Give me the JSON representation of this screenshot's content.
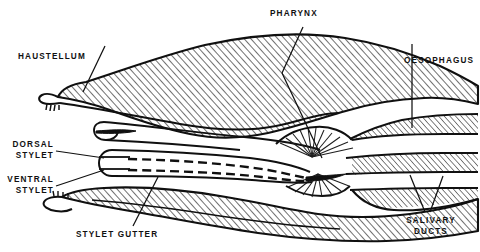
{
  "figure": {
    "type": "anatomical-line-diagram",
    "background_color": "#ffffff",
    "ink_color": "#101010",
    "hatch_color": "#1a1a1a"
  },
  "labels": {
    "haustellum": "HAUSTELLUM",
    "pharynx": "PHARYNX",
    "oesophagus": "OESOPHAGUS",
    "dorsal_stylet": "DORSAL\nSTYLET",
    "ventral_stylet": "VENTRAL\nSTYLET",
    "stylet_gutter": "STYLET GUTTER",
    "salivary_ducts": "SALIVARY\nDUCTS"
  },
  "structures": [
    {
      "name": "labrum-upper-body",
      "hatched": true
    },
    {
      "name": "pharynx-lumen",
      "hatched": false
    },
    {
      "name": "pharyngeal-dilator-muscles",
      "hatched": false
    },
    {
      "name": "oesophagus-channel",
      "hatched": false
    },
    {
      "name": "hypopharynx-stylet",
      "hatched": false
    },
    {
      "name": "labium-lower-body",
      "hatched": true
    },
    {
      "name": "stylet-gutter-channel",
      "hatched": false
    },
    {
      "name": "salivary-duct-channel",
      "hatched": false
    }
  ]
}
